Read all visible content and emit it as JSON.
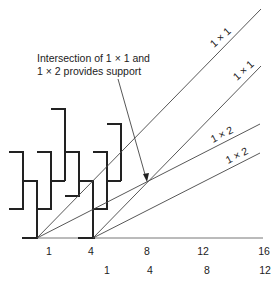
{
  "annotation": {
    "line1": "Intersection of 1 × 1 and",
    "line2": "1 × 2 provides support"
  },
  "lines": [
    {
      "label": "1 × 1",
      "origin": 1
    },
    {
      "label": "1 × 1",
      "origin": 4
    },
    {
      "label": "1 × 2",
      "origin": 1
    },
    {
      "label": "1 × 2",
      "origin": 4
    }
  ],
  "axis_top_labels": [
    "1",
    "4",
    "8",
    "12",
    "16"
  ],
  "axis_bottom_labels": [
    "1",
    "4",
    "8",
    "12"
  ],
  "colors": {
    "stroke": "#333333",
    "text": "#222222"
  }
}
